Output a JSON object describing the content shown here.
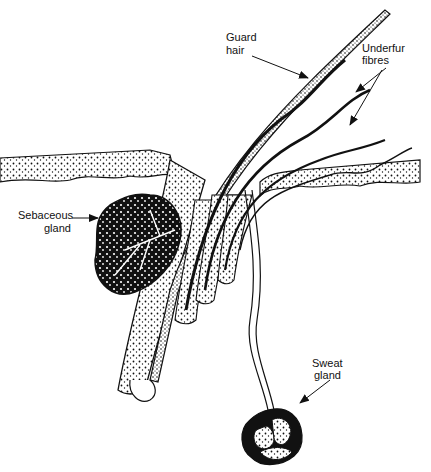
{
  "labels": {
    "guard_hair": [
      "Guard",
      "hair"
    ],
    "underfur": [
      "Underfur",
      "fibres"
    ],
    "sebaceous": [
      "Sebaceous",
      "gland"
    ],
    "sweat": [
      "Sweat",
      "gland"
    ]
  },
  "colors": {
    "ink": "#111111",
    "paper": "#ffffff"
  }
}
